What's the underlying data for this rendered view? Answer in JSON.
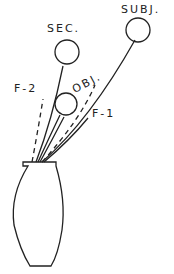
{
  "diagram": {
    "labels": {
      "subj": "SUBJ.",
      "sec": "SEC.",
      "obj": "OBJ.",
      "f1": "F-1",
      "f2": "F-2"
    },
    "colors": {
      "stroke": "#222222",
      "background": "#ffffff"
    }
  }
}
